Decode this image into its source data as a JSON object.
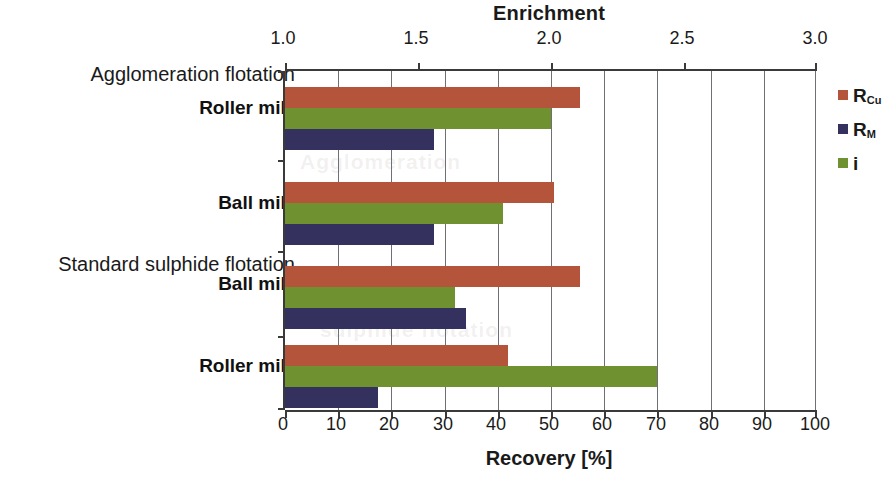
{
  "chart_data": {
    "type": "bar",
    "orientation": "horizontal",
    "title": "",
    "top_axis": {
      "label": "Enrichment",
      "ticks": [
        1.0,
        1.5,
        2.0,
        2.5,
        3.0
      ],
      "tick_labels": [
        "1.0",
        "1.5",
        "2.0",
        "2.5",
        "3.0"
      ],
      "range": [
        1.0,
        3.0
      ]
    },
    "bottom_axis": {
      "label": "Recovery [%]",
      "ticks": [
        0,
        10,
        20,
        30,
        40,
        50,
        60,
        70,
        80,
        90,
        100
      ],
      "tick_labels": [
        "0",
        "10",
        "20",
        "30",
        "40",
        "50",
        "60",
        "70",
        "80",
        "90",
        "100"
      ],
      "range": [
        0,
        100
      ]
    },
    "grid": true,
    "legend_position": "right",
    "legend": [
      {
        "name": "R_Cu",
        "text": "R",
        "sub": "Cu",
        "color": "#b4543a",
        "axis": "bottom"
      },
      {
        "name": "R_M",
        "text": "R",
        "sub": "M",
        "color": "#34315e",
        "axis": "bottom"
      },
      {
        "name": "i",
        "text": "i",
        "sub": "",
        "color": "#6f9130",
        "axis": "top"
      }
    ],
    "groups": [
      {
        "header": "Agglomeration flotation",
        "category": "Roller mill",
        "bars": [
          {
            "series": "R_Cu",
            "value": 55.5,
            "unit": "%"
          },
          {
            "series": "i",
            "value": 50.0,
            "unit": "%",
            "enrichment": 2.05
          },
          {
            "series": "R_M",
            "value": 28.0,
            "unit": "%"
          }
        ]
      },
      {
        "header": "",
        "category": "Ball mill",
        "bars": [
          {
            "series": "R_Cu",
            "value": 50.5,
            "unit": "%"
          },
          {
            "series": "i",
            "value": 41.0,
            "unit": "%",
            "enrichment": 1.87
          },
          {
            "series": "R_M",
            "value": 28.0,
            "unit": "%"
          }
        ]
      },
      {
        "header": "Standard sulphide flotation",
        "category": "Ball mill",
        "bars": [
          {
            "series": "R_Cu",
            "value": 55.5,
            "unit": "%"
          },
          {
            "series": "i",
            "value": 32.0,
            "unit": "%",
            "enrichment": 1.66
          },
          {
            "series": "R_M",
            "value": 34.0,
            "unit": "%"
          }
        ]
      },
      {
        "header": "",
        "category": "Roller mill",
        "bars": [
          {
            "series": "R_Cu",
            "value": 42.0,
            "unit": "%"
          },
          {
            "series": "i",
            "value": 70.0,
            "unit": "%",
            "enrichment": 2.4
          },
          {
            "series": "R_M",
            "value": 17.5,
            "unit": "%"
          }
        ]
      }
    ],
    "categories": [
      "Roller mill",
      "Ball mill",
      "Ball mill",
      "Roller mill"
    ],
    "series": [
      {
        "name": "R_Cu",
        "values": [
          55.5,
          50.5,
          55.5,
          42.0
        ]
      },
      {
        "name": "R_M",
        "values": [
          28.0,
          28.0,
          34.0,
          17.5
        ]
      },
      {
        "name": "i",
        "values": [
          50.0,
          41.0,
          32.0,
          70.0
        ]
      }
    ]
  },
  "colors": {
    "rcu": "#b4543a",
    "rm": "#34315e",
    "i": "#6f9130",
    "axis": "#3a3a3a",
    "grid": "#6f6f76"
  },
  "ghost_text": {
    "a": "Agglomeration",
    "b": "sulphide flotation"
  }
}
